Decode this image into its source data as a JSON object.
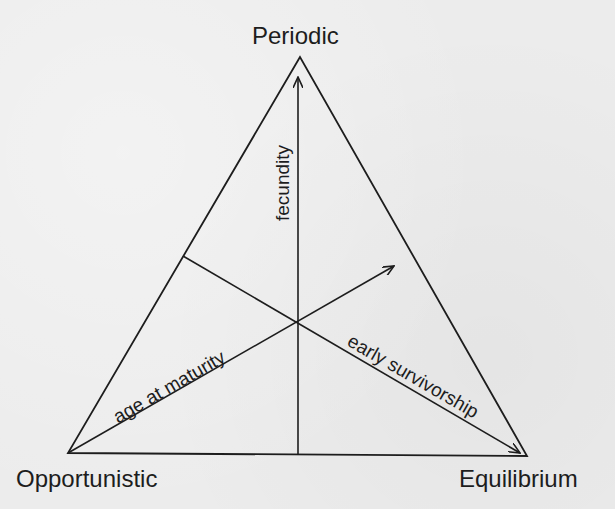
{
  "diagram": {
    "type": "ternary-triangle",
    "vertices": {
      "top": "Periodic",
      "bottom_left": "Opportunistic",
      "bottom_right": "Equilibrium"
    },
    "axes": {
      "vertical": "fecundity",
      "rising_diagonal": "age at maturity",
      "falling_diagonal": "early survivorship"
    },
    "colors": {
      "ink": "#1d1d1d",
      "paper": "#ececec"
    }
  }
}
